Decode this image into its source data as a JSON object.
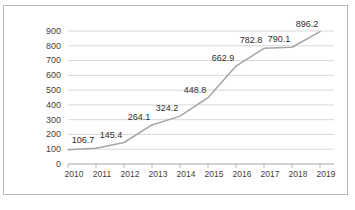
{
  "chart_data": {
    "type": "line",
    "title": "",
    "subtitle": "",
    "xlabel": "",
    "ylabel": "",
    "categories": [
      "2010",
      "2011",
      "2012",
      "2013",
      "2014",
      "2015",
      "2016",
      "2017",
      "2018",
      "2019"
    ],
    "x": [
      2010,
      2011,
      2012,
      2013,
      2014,
      2015,
      2016,
      2017,
      2018,
      2019
    ],
    "series": [
      {
        "name": "",
        "values": [
          96.5,
          106.7,
          145.4,
          264.1,
          324.2,
          448.8,
          662.9,
          782.8,
          790.1,
          896.2
        ]
      }
    ],
    "point_labels": [
      "",
      "106.7",
      "145.4",
      "264.1",
      "324.2",
      "448.8",
      "662.9",
      "782.8",
      "790.1",
      "896.2"
    ],
    "ylim": [
      0,
      900
    ],
    "yticks": [
      0,
      100,
      200,
      300,
      400,
      500,
      600,
      700,
      800,
      900
    ],
    "ytick_labels": [
      "0",
      "100",
      "200",
      "300",
      "400",
      "500",
      "600",
      "700",
      "800",
      "900"
    ],
    "grid": true,
    "grid_axis": "y",
    "legend": false,
    "legend_position": "none",
    "line_color": "#a6a6a6",
    "grid_color": "#c9c9c9",
    "axis_color": "#9a9a9a",
    "label_color": "#2e2e2e",
    "border_color": "#b9b9b9",
    "background_color": "#ffffff",
    "markers": false
  }
}
